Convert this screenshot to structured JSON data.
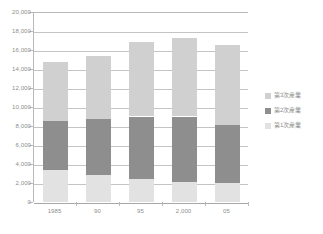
{
  "chart_data": {
    "type": "bar",
    "stacked": true,
    "title": "",
    "xlabel": "",
    "ylabel": "",
    "categories": [
      "1985",
      "90",
      "95",
      "2,000",
      "05"
    ],
    "ylim": [
      0,
      20000
    ],
    "y_ticks": [
      "0",
      "2,000",
      "4,000",
      "6,000",
      "8,000",
      "10,000",
      "12,000",
      "14,000",
      "16,000",
      "18,000",
      "20,000"
    ],
    "y_tick_values": [
      0,
      2000,
      4000,
      6000,
      8000,
      10000,
      12000,
      14000,
      16000,
      18000,
      20000
    ],
    "grid": true,
    "legend_position": "right",
    "series": [
      {
        "name": "第1次産業",
        "color": "#e2e2e2",
        "values": [
          3400,
          2800,
          2400,
          2100,
          2000
        ]
      },
      {
        "name": "第2次産業",
        "color": "#8e8e8e",
        "values": [
          5100,
          5900,
          6600,
          6900,
          6100
        ]
      },
      {
        "name": "第3次産業",
        "color": "#d0d0d0",
        "values": [
          6200,
          6700,
          7800,
          8300,
          8400
        ]
      }
    ],
    "totals": [
      14700,
      15400,
      16800,
      17300,
      16500
    ]
  },
  "legend": {
    "items": [
      {
        "label": "第3次産業",
        "color": "#d0d0d0"
      },
      {
        "label": "第2次産業",
        "color": "#8e8e8e"
      },
      {
        "label": "第1次産業",
        "color": "#e2e2e2"
      }
    ]
  },
  "colors": {
    "primary": "#e2e2e2",
    "secondary": "#8e8e8e",
    "tertiary": "#d0d0d0",
    "grid": "#c4c4c4",
    "axis": "#b9b9b9",
    "text": "#8d8d8d",
    "background": "#ffffff"
  }
}
